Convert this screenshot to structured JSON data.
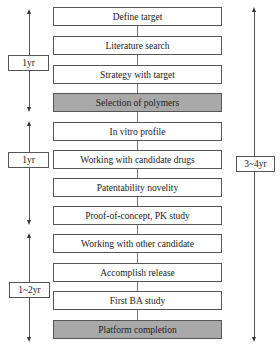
{
  "steps": [
    {
      "label": "Define target",
      "milestone": false
    },
    {
      "label": "Literature search",
      "milestone": false
    },
    {
      "label": "Strategy with target",
      "milestone": false
    },
    {
      "label": "Selection of polymers",
      "milestone": true
    },
    {
      "label": "In vitro profile",
      "milestone": false
    },
    {
      "label": "Working with candidate drugs",
      "milestone": false
    },
    {
      "label": "Patentability novelity",
      "milestone": false
    },
    {
      "label": "Proof-of-concept, PK study",
      "milestone": false
    },
    {
      "label": "Working with other candidate",
      "milestone": false
    },
    {
      "label": "Accomplish release",
      "milestone": false
    },
    {
      "label": "First BA study",
      "milestone": false
    },
    {
      "label": "Platform completion",
      "milestone": true
    }
  ],
  "phases": [
    {
      "label": "1yr",
      "from_step": 1,
      "to_step": 4
    },
    {
      "label": "1yr",
      "from_step": 5,
      "to_step": 8
    },
    {
      "label": "1~2yr",
      "from_step": 9,
      "to_step": 12
    }
  ],
  "total": {
    "label": "3~4yr",
    "from_step": 1,
    "to_step": 12
  },
  "colors": {
    "milestone_fill": "#a9a9a9",
    "step_fill": "#ffffff",
    "stroke": "#555555"
  }
}
